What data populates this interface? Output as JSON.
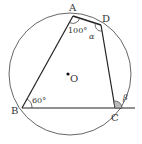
{
  "diagram": {
    "type": "inscribed-quadrilateral",
    "circle": {
      "center_label": "O"
    },
    "points": {
      "A": "A",
      "B": "B",
      "C": "C",
      "D": "D"
    },
    "angles": {
      "at_A": "100°",
      "at_B": "60°",
      "at_D": "α",
      "exterior_at_C": "β"
    },
    "colors": {
      "line": "#222222",
      "circle": "#555555",
      "angle_fill": "#bbbbbb"
    }
  }
}
